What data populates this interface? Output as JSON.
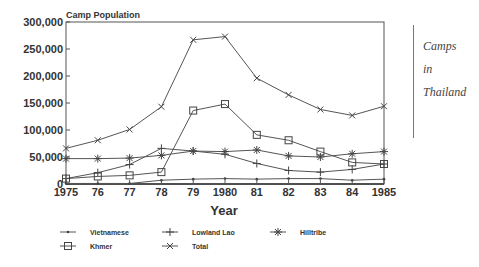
{
  "side_note": {
    "line1": "Camps",
    "line2": "in",
    "line3": "Thailand"
  },
  "chart_data": {
    "type": "line",
    "title": "Camp Population",
    "xlabel": "Year",
    "ylabel": "",
    "ylim": [
      0,
      300000
    ],
    "yticks": [
      0,
      50000,
      100000,
      150000,
      200000,
      250000,
      300000
    ],
    "ytick_labels": [
      "0",
      "50,000",
      "100,000",
      "150,000",
      "200,000",
      "250,000",
      "300,000"
    ],
    "x": [
      1975,
      1976,
      1977,
      1978,
      1979,
      1980,
      1981,
      1982,
      1983,
      1984,
      1985
    ],
    "xtick_labels": [
      "1975",
      "76",
      "77",
      "78",
      "79",
      "1980",
      "81",
      "82",
      "83",
      "84",
      "1985"
    ],
    "grid": false,
    "legend_position": "bottom",
    "series": [
      {
        "name": "Vietnamese",
        "marker": "dot",
        "values": [
          1000,
          1000,
          1000,
          7000,
          9000,
          10000,
          9000,
          10000,
          10000,
          7000,
          9000
        ]
      },
      {
        "name": "Lowland Lao",
        "marker": "plus",
        "values": [
          10000,
          21000,
          36000,
          66000,
          61000,
          55000,
          38000,
          25000,
          22000,
          27000,
          37000
        ]
      },
      {
        "name": "Hilltribe",
        "marker": "star",
        "values": [
          47000,
          47000,
          48000,
          53000,
          61000,
          60000,
          63000,
          52000,
          50000,
          56000,
          60000
        ]
      },
      {
        "name": "Khmer",
        "marker": "square",
        "values": [
          10000,
          14000,
          16000,
          22000,
          136000,
          148000,
          91000,
          81000,
          60000,
          40000,
          37000
        ]
      },
      {
        "name": "Total",
        "marker": "x",
        "values": [
          66000,
          81000,
          101000,
          143000,
          267000,
          273000,
          196000,
          165000,
          138000,
          127000,
          144000
        ]
      }
    ]
  }
}
